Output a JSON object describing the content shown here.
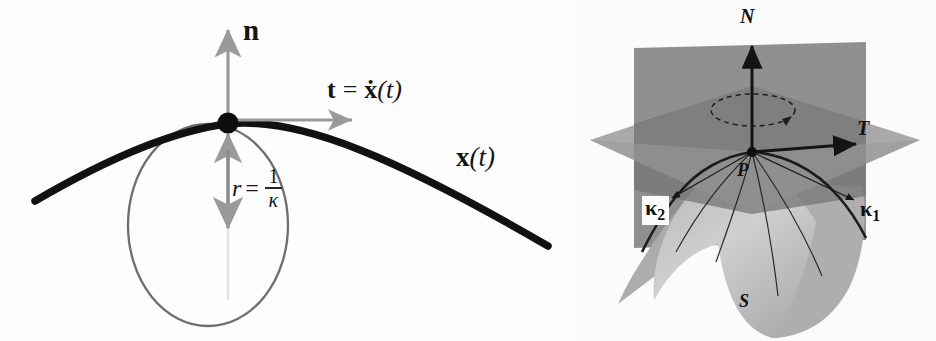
{
  "figure": {
    "panels": [
      {
        "id": "left",
        "name": "osculating-circle-diagram"
      },
      {
        "id": "right",
        "name": "principal-curvature-surface-diagram"
      }
    ]
  },
  "left_panel": {
    "name": "osculating-circle-diagram",
    "labels": {
      "normal_vector": "n",
      "tangent_lhs": "t",
      "tangent_eq": "=",
      "tangent_rhs_vec": "ẋ",
      "tangent_rhs_arg": "(t)",
      "curve": "x",
      "curve_arg": "(t)",
      "radius_lhs": "r",
      "radius_eq": "=",
      "radius_numerator": "1",
      "radius_denominator": "κ"
    },
    "colors": {
      "curve": "#111111",
      "circle": "#6e6e6e",
      "arrow": "#9a9a9a",
      "point": "#0d0d0d",
      "background": "#fdfdfd"
    },
    "elements": {
      "tangent_point_label": "tangency point",
      "osculating_circle_label": "osculating circle",
      "curve_label": "plane curve",
      "normal_arrow_label": "unit normal arrow",
      "tangent_arrow_label": "unit tangent arrow",
      "radius_arrow_label": "radius of curvature arrow"
    }
  },
  "right_panel": {
    "name": "principal-curvature-surface-diagram",
    "labels": {
      "normal_axis": "N",
      "tangent_axis": "T",
      "point": "P",
      "surface": "S",
      "principal_curvature_1_sym": "κ",
      "principal_curvature_1_sub": "1",
      "principal_curvature_2_sym": "κ",
      "principal_curvature_2_sub": "2"
    },
    "colors": {
      "normal_plane": "#8d8d8d",
      "tangent_plane": "#9d9d9d",
      "plane_overlap": "#6f6f6f",
      "surface_light": "#c6c6c6",
      "surface_mid": "#a8a8a8",
      "surface_dark": "#8a8a8a",
      "curve_line": "#1c1c1c",
      "axis": "#141414",
      "background": "#fbfbfb"
    },
    "elements": {
      "normal_plane_label": "normal plane",
      "tangent_plane_label": "tangent plane",
      "surface_label": "saddle surface",
      "rotation_arrow_label": "dashed rotation arrow",
      "normal_axis_label": "normal axis arrow",
      "tangent_axis_label": "tangent axis arrow",
      "principal_direction_1_label": "principal direction 1 pointer",
      "principal_direction_2_label": "principal direction 2 pointer"
    }
  }
}
